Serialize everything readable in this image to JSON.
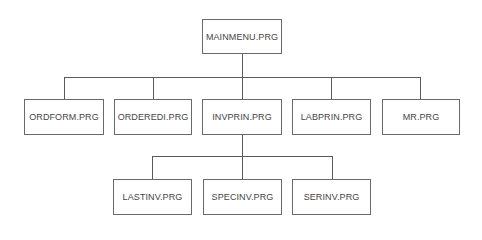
{
  "diagram": {
    "type": "hierarchy-chart",
    "root": {
      "label": "MAINMENU.PRG"
    },
    "level1": [
      {
        "label": "ORDFORM.PRG"
      },
      {
        "label": "ORDEREDI.PRG"
      },
      {
        "label": "INVPRIN.PRG"
      },
      {
        "label": "LABPRIN.PRG"
      },
      {
        "label": "MR.PRG"
      }
    ],
    "level2": [
      {
        "label": "LASTINV.PRG",
        "parent": "INVPRIN.PRG"
      },
      {
        "label": "SPECINV.PRG",
        "parent": "INVPRIN.PRG"
      },
      {
        "label": "SERINV.PRG",
        "parent": "INVPRIN.PRG"
      }
    ],
    "colors": {
      "line": "#5a5a5a",
      "box_border": "#6a6a6a",
      "text": "#444444",
      "background": "#ffffff"
    }
  }
}
